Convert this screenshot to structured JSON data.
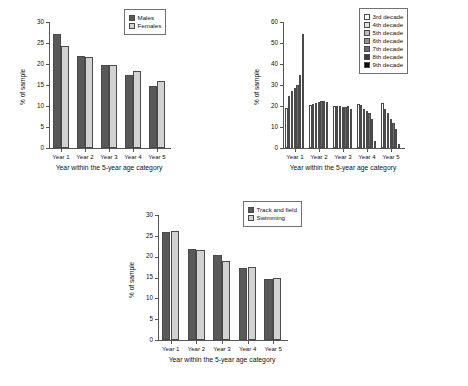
{
  "figure": {
    "panels": [
      "sex",
      "decade",
      "sport"
    ]
  },
  "chart_data": [
    {
      "id": "panel-a",
      "type": "bar",
      "title": "",
      "xlabel": "Year within the 5-year age category",
      "ylabel": "% of sample",
      "categories": [
        "Year 1",
        "Year 2",
        "Year 3",
        "Year 4",
        "Year 5"
      ],
      "ylim": [
        0,
        30
      ],
      "yticks": [
        0,
        5,
        10,
        15,
        20,
        25,
        30
      ],
      "grid": false,
      "legend_position": "top-right",
      "series": [
        {
          "name": "Males",
          "color": "#595959",
          "values": [
            27.1,
            21.9,
            19.8,
            17.3,
            14.7
          ]
        },
        {
          "name": "Females",
          "color": "#d2d2d2",
          "values": [
            24.4,
            21.6,
            19.8,
            18.3,
            15.9
          ]
        }
      ]
    },
    {
      "id": "panel-b",
      "type": "bar",
      "title": "",
      "xlabel": "Year within the 5-year age category",
      "ylabel": "% of sample",
      "categories": [
        "Year 1",
        "Year 2",
        "Year 3",
        "Year 4",
        "Year 5"
      ],
      "ylim": [
        0,
        60
      ],
      "yticks": [
        0,
        10,
        20,
        30,
        40,
        50,
        60
      ],
      "grid": false,
      "legend_position": "top-right",
      "series": [
        {
          "name": "3rd decade",
          "color": "#ffffff",
          "values": [
            19.2,
            20.5,
            20.2,
            21.0,
            21.3
          ]
        },
        {
          "name": "4th decade",
          "color": "#e2e2e2",
          "values": [
            24.8,
            20.9,
            19.8,
            20.6,
            18.4
          ]
        },
        {
          "name": "5th decade",
          "color": "#bdbdbd",
          "values": [
            27.0,
            21.6,
            19.9,
            18.4,
            16.6
          ]
        },
        {
          "name": "6th decade",
          "color": "#949494",
          "values": [
            28.6,
            21.9,
            19.6,
            17.5,
            14.0
          ]
        },
        {
          "name": "7th decade",
          "color": "#6b6b6b",
          "values": [
            29.8,
            22.2,
            19.7,
            16.6,
            11.8
          ]
        },
        {
          "name": "8th decade",
          "color": "#3d3d3d",
          "values": [
            34.8,
            22.6,
            19.8,
            13.6,
            9.0
          ]
        },
        {
          "name": "9th decade",
          "color": "#0a0a0a",
          "values": [
            54.2,
            22.0,
            18.8,
            3.2,
            2.0
          ]
        }
      ]
    },
    {
      "id": "panel-c",
      "type": "bar",
      "title": "",
      "xlabel": "Year within the 5-year age category",
      "ylabel": "% of sample",
      "categories": [
        "Year 1",
        "Year 2",
        "Year 3",
        "Year 4",
        "Year 5"
      ],
      "ylim": [
        0,
        30
      ],
      "yticks": [
        0,
        5,
        10,
        15,
        20,
        25,
        30
      ],
      "grid": false,
      "legend_position": "top-right",
      "series": [
        {
          "name": "Track and field",
          "color": "#595959",
          "values": [
            25.9,
            21.8,
            20.3,
            17.3,
            14.7
          ]
        },
        {
          "name": "Swimming",
          "color": "#d2d2d2",
          "values": [
            26.2,
            21.5,
            19.0,
            17.6,
            15.0
          ]
        }
      ]
    }
  ]
}
